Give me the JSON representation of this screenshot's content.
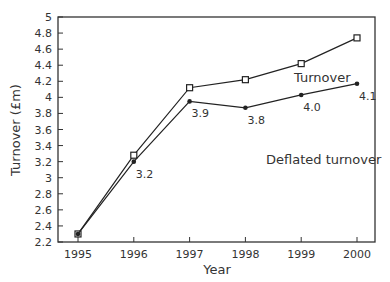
{
  "chart_data": {
    "type": "line",
    "title": "",
    "xlabel": "Year",
    "ylabel": "Turnover (£m)",
    "x": [
      1995,
      1996,
      1997,
      1998,
      1999,
      2000
    ],
    "xticks": [
      "1995",
      "1996",
      "1997",
      "1998",
      "1999",
      "2000"
    ],
    "yticks": [
      "2.2",
      "2.4",
      "2.6",
      "2.8",
      "3",
      "3.2",
      "3.4",
      "3.6",
      "3.8",
      "4",
      "4.2",
      "4.4",
      "4.6",
      "4.8",
      "5"
    ],
    "ylim": [
      2.2,
      5
    ],
    "grid": false,
    "legend_position": "inline labels",
    "series": [
      {
        "name": "Turnover",
        "marker": "open-square",
        "values": [
          2.3,
          3.28,
          4.12,
          4.22,
          4.42,
          4.74
        ]
      },
      {
        "name": "Deflated turnover",
        "marker": "filled-dot",
        "values": [
          2.3,
          3.2,
          3.95,
          3.87,
          4.03,
          4.17
        ],
        "data_labels": [
          "",
          "3.2",
          "3.9",
          "3.8",
          "4.0",
          "4.1"
        ]
      }
    ]
  }
}
